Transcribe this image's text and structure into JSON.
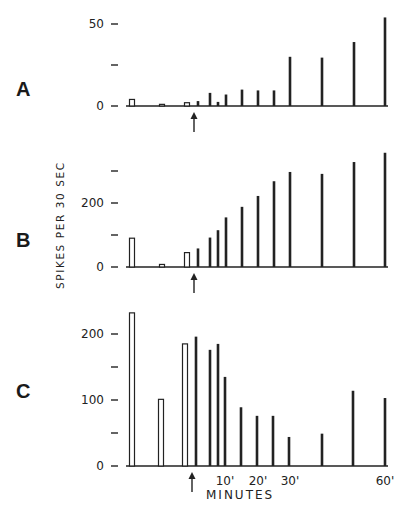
{
  "figure": {
    "ylabel": "SPIKES PER 30 SEC",
    "xlabel": "MINUTES",
    "x_tick_labels": [
      "10'",
      "20'",
      "30'",
      "60'"
    ],
    "arrow_marker": "stimulus-onset-arrow"
  },
  "chart_data": [
    {
      "type": "bar",
      "panel": "A",
      "title": "",
      "xlabel": "MINUTES",
      "ylabel": "SPIKES PER 30 SEC",
      "ylim": [
        0,
        55
      ],
      "yticks": [
        0,
        25,
        50
      ],
      "ytick_labels": [
        "0",
        "",
        "50"
      ],
      "grid": false,
      "legend": "none",
      "bars": [
        {
          "x": 132,
          "value": 4,
          "style": "open"
        },
        {
          "x": 162,
          "value": 1,
          "style": "open"
        },
        {
          "x": 187,
          "value": 2,
          "style": "open"
        },
        {
          "x": 198,
          "value": 3,
          "style": "filled"
        },
        {
          "x": 210,
          "value": 8,
          "style": "filled"
        },
        {
          "x": 218,
          "value": 2.5,
          "style": "filled"
        },
        {
          "x": 226,
          "value": 7,
          "style": "filled"
        },
        {
          "x": 242,
          "value": 10,
          "style": "filled"
        },
        {
          "x": 258,
          "value": 9.5,
          "style": "filled"
        },
        {
          "x": 274,
          "value": 9.5,
          "style": "filled"
        },
        {
          "x": 290,
          "value": 30,
          "style": "filled"
        },
        {
          "x": 322,
          "value": 29.5,
          "style": "filled"
        },
        {
          "x": 354,
          "value": 39,
          "style": "filled"
        },
        {
          "x": 385,
          "value": 54,
          "style": "filled"
        }
      ],
      "arrow_x": 194
    },
    {
      "type": "bar",
      "panel": "B",
      "title": "",
      "xlabel": "MINUTES",
      "ylabel": "SPIKES PER 30 SEC",
      "ylim": [
        0,
        370
      ],
      "yticks": [
        0,
        100,
        200,
        300
      ],
      "ytick_labels": [
        "0",
        "",
        "200",
        ""
      ],
      "grid": false,
      "legend": "none",
      "bars": [
        {
          "x": 132,
          "value": 90,
          "style": "open"
        },
        {
          "x": 162,
          "value": 8,
          "style": "open"
        },
        {
          "x": 187,
          "value": 45,
          "style": "open"
        },
        {
          "x": 198,
          "value": 58,
          "style": "filled"
        },
        {
          "x": 210,
          "value": 92,
          "style": "filled"
        },
        {
          "x": 218,
          "value": 115,
          "style": "filled"
        },
        {
          "x": 226,
          "value": 155,
          "style": "filled"
        },
        {
          "x": 242,
          "value": 188,
          "style": "filled"
        },
        {
          "x": 258,
          "value": 222,
          "style": "filled"
        },
        {
          "x": 274,
          "value": 268,
          "style": "filled"
        },
        {
          "x": 290,
          "value": 297,
          "style": "filled"
        },
        {
          "x": 322,
          "value": 291,
          "style": "filled"
        },
        {
          "x": 354,
          "value": 328,
          "style": "filled"
        },
        {
          "x": 385,
          "value": 357,
          "style": "filled"
        }
      ],
      "arrow_x": 194
    },
    {
      "type": "bar",
      "panel": "C",
      "title": "",
      "xlabel": "MINUTES",
      "ylabel": "SPIKES PER 30 SEC",
      "ylim": [
        0,
        240
      ],
      "yticks": [
        0,
        50,
        100,
        150,
        200
      ],
      "ytick_labels": [
        "0",
        "",
        "100",
        "",
        "200"
      ],
      "xtick_positions": [
        225,
        258,
        290,
        385
      ],
      "xtick_labels": [
        "10'",
        "20'",
        "30'",
        "60'"
      ],
      "grid": false,
      "legend": "none",
      "bars": [
        {
          "x": 132,
          "value": 232,
          "style": "open"
        },
        {
          "x": 161,
          "value": 101,
          "style": "open"
        },
        {
          "x": 185,
          "value": 185,
          "style": "open"
        },
        {
          "x": 196,
          "value": 196,
          "style": "filled"
        },
        {
          "x": 210,
          "value": 176,
          "style": "filled"
        },
        {
          "x": 218,
          "value": 185,
          "style": "filled"
        },
        {
          "x": 225,
          "value": 135,
          "style": "filled"
        },
        {
          "x": 241,
          "value": 89,
          "style": "filled"
        },
        {
          "x": 257,
          "value": 76,
          "style": "filled"
        },
        {
          "x": 273,
          "value": 76,
          "style": "filled"
        },
        {
          "x": 289,
          "value": 44,
          "style": "filled"
        },
        {
          "x": 322,
          "value": 49,
          "style": "filled"
        },
        {
          "x": 353,
          "value": 114,
          "style": "filled"
        },
        {
          "x": 385,
          "value": 103,
          "style": "filled"
        }
      ],
      "arrow_x": 192
    }
  ]
}
